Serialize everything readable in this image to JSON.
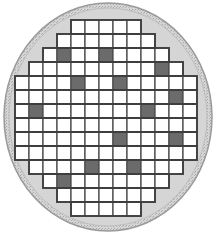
{
  "figure": {
    "name": "wafer-map",
    "type": "semiconductor-wafer-die-map",
    "width": 216,
    "height": 234
  },
  "colors": {
    "background": "#ffffff",
    "wafer_fill": "#d5d5d5",
    "wafer_rim": "#bdbdbd",
    "wafer_rim_outer": "#9a9a9a",
    "die_good_fill": "#ffffff",
    "die_bad_fill": "#6b6b6b",
    "die_stroke": "#4d4d4d",
    "grid_outline": "#3d3d3d"
  },
  "wafer": {
    "label": "wafer-disc",
    "center_x": 108,
    "center_y": 117,
    "radius_x": 104,
    "radius_y": 114,
    "rim_thickness": 5
  },
  "grid": {
    "label": "die-grid",
    "columns": 13,
    "rows": 14,
    "cell_width": 14,
    "cell_height": 14,
    "origin_x": 15,
    "origin_y": 20,
    "stroke_width": 1.3
  },
  "legend": {
    "good_label": "good die",
    "bad_label": "defective die"
  },
  "chart_data": {
    "type": "heatmap",
    "xlabel": "",
    "ylabel": "",
    "columns": 13,
    "rows": 14,
    "value_labels": {
      "0": "good",
      "1": "defective",
      "-1": "outside wafer"
    },
    "counts": {
      "total_dies": 140,
      "good_dies": 127,
      "defective_dies": 13
    },
    "row_extents": [
      {
        "row": 0,
        "start_col": 4,
        "end_col": 8
      },
      {
        "row": 1,
        "start_col": 3,
        "end_col": 9
      },
      {
        "row": 2,
        "start_col": 2,
        "end_col": 10
      },
      {
        "row": 3,
        "start_col": 1,
        "end_col": 11
      },
      {
        "row": 4,
        "start_col": 0,
        "end_col": 12
      },
      {
        "row": 5,
        "start_col": 0,
        "end_col": 12
      },
      {
        "row": 6,
        "start_col": 0,
        "end_col": 12
      },
      {
        "row": 7,
        "start_col": 0,
        "end_col": 12
      },
      {
        "row": 8,
        "start_col": 0,
        "end_col": 12
      },
      {
        "row": 9,
        "start_col": 0,
        "end_col": 12
      },
      {
        "row": 10,
        "start_col": 1,
        "end_col": 11
      },
      {
        "row": 11,
        "start_col": 2,
        "end_col": 10
      },
      {
        "row": 12,
        "start_col": 3,
        "end_col": 9
      },
      {
        "row": 13,
        "start_col": 4,
        "end_col": 8
      }
    ],
    "defective_cells": [
      {
        "row": 2,
        "col": 3
      },
      {
        "row": 2,
        "col": 6
      },
      {
        "row": 3,
        "col": 10
      },
      {
        "row": 4,
        "col": 4
      },
      {
        "row": 4,
        "col": 7
      },
      {
        "row": 6,
        "col": 1
      },
      {
        "row": 6,
        "col": 9
      },
      {
        "row": 8,
        "col": 7
      },
      {
        "row": 8,
        "col": 11
      },
      {
        "row": 10,
        "col": 5
      },
      {
        "row": 10,
        "col": 8
      },
      {
        "row": 5,
        "col": 11
      },
      {
        "row": 11,
        "col": 3
      }
    ]
  }
}
